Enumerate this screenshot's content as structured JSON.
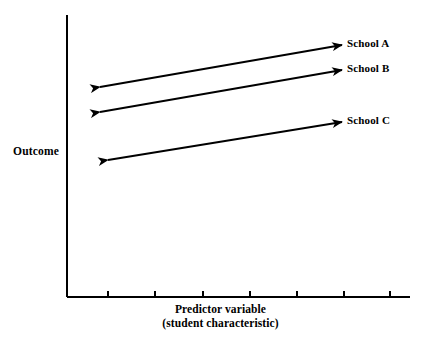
{
  "figure": {
    "width": 441,
    "height": 344,
    "background": "#ffffff",
    "ink_color": "#000000"
  },
  "axes": {
    "y_title": "Outcome",
    "x_title_line1": "Predictor variable",
    "x_title_line2": "(student characteristic)"
  },
  "chart_data": {
    "type": "line",
    "title": "",
    "subtitle": "",
    "xlabel": "Predictor variable (student characteristic)",
    "ylabel": "Outcome",
    "xlim": [
      0,
      7
    ],
    "ylim": [
      0,
      10
    ],
    "grid": false,
    "legend_position": "right-inline-at-line-end",
    "axis_tick_labels": {
      "x": [],
      "y": []
    },
    "x_tick_count": 7,
    "y_tick_count": 0,
    "annotation": "Three parallel upward-sloping double-headed arrows representing within-school regression slopes of outcome on student characteristic for School A, School B and School C; the slopes are equal and the schools differ only in intercept (vertical offset).",
    "series": [
      {
        "name": "School A",
        "label": "School A",
        "color": "#000000",
        "marker": "double-arrow",
        "x": [
          0.88,
          6.0
        ],
        "y": [
          8.05,
          9.0
        ]
      },
      {
        "name": "School B",
        "label": "School B",
        "color": "#000000",
        "marker": "double-arrow",
        "x": [
          0.88,
          6.0
        ],
        "y": [
          7.5,
          8.45
        ]
      },
      {
        "name": "School C",
        "label": "School C",
        "color": "#000000",
        "marker": "double-arrow",
        "x": [
          1.06,
          6.0
        ],
        "y": [
          6.45,
          7.3
        ]
      }
    ]
  },
  "geometry": {
    "y_axis": {
      "x": 67,
      "y_top": 15,
      "y_bottom": 297
    },
    "x_axis": {
      "y": 297,
      "x_left": 67,
      "x_right": 410
    },
    "x_ticks": [
      108,
      155,
      203,
      250,
      297,
      344,
      390
    ],
    "tick_length": 6,
    "arrows": [
      {
        "name": "School A",
        "x1": 100,
        "y1": 87,
        "x2": 342,
        "y2": 45
      },
      {
        "name": "School B",
        "x1": 100,
        "y1": 112,
        "x2": 342,
        "y2": 70
      },
      {
        "name": "School C",
        "x1": 108,
        "y1": 160,
        "x2": 342,
        "y2": 122
      }
    ]
  }
}
